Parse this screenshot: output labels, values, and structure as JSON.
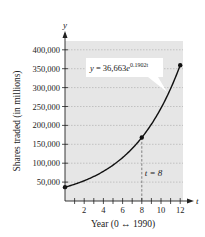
{
  "chart_data": {
    "type": "line",
    "title": "",
    "xlabel": "Year (0 ↔ 1990)",
    "ylabel": "Shares traded (in millions)",
    "x_axis_symbol": "t",
    "y_axis_symbol": "y",
    "xlim": [
      0,
      12.8
    ],
    "ylim": [
      0,
      420000
    ],
    "x_ticks": [
      1,
      2,
      3,
      4,
      5,
      6,
      7,
      8,
      9,
      10,
      11,
      12
    ],
    "x_tick_labels": [
      {
        "value": 2,
        "label": "2"
      },
      {
        "value": 4,
        "label": "4"
      },
      {
        "value": 6,
        "label": "6"
      },
      {
        "value": 8,
        "label": "8"
      },
      {
        "value": 10,
        "label": "10"
      },
      {
        "value": 12,
        "label": "12"
      }
    ],
    "y_ticks": [
      {
        "value": 50000,
        "label": "50,000"
      },
      {
        "value": 100000,
        "label": "100,000"
      },
      {
        "value": 150000,
        "label": "150,000"
      },
      {
        "value": 200000,
        "label": "200,000"
      },
      {
        "value": 250000,
        "label": "250,000"
      },
      {
        "value": 300000,
        "label": "300,000"
      },
      {
        "value": 350000,
        "label": "350,000"
      },
      {
        "value": 400000,
        "label": "400,000"
      }
    ],
    "grid": true,
    "background": "#e6e6e6",
    "series": [
      {
        "name": "y = 36,663e^(0.1902t)",
        "model": {
          "a": 36663,
          "k": 0.1902
        },
        "t_range": [
          0,
          12
        ],
        "color": "#111111",
        "marked_points": [
          {
            "t": 0,
            "y": 36663
          },
          {
            "t": 8,
            "y": 167900
          },
          {
            "t": 12,
            "y": 359400
          }
        ]
      }
    ],
    "annotations": [
      {
        "type": "callout",
        "text_base": "y = 36,663e",
        "text_exp": "0.1902t",
        "points_to_t": 11
      },
      {
        "type": "vline",
        "t": 8,
        "style": "dashed",
        "label": "t = 8"
      }
    ]
  }
}
